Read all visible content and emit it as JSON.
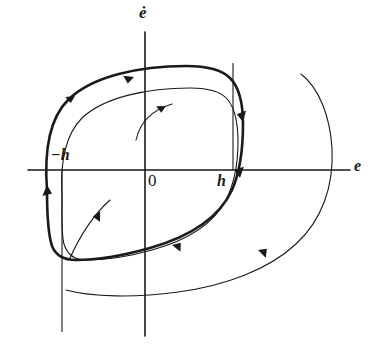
{
  "figure": {
    "background_color": "#ffffff",
    "ink_color": "#1a1a1a",
    "width": 380,
    "height": 350
  },
  "axes": {
    "horizontal": {
      "label": "e",
      "origin_px": [
        145,
        170
      ],
      "x_start_px": 28,
      "x_end_px": 350
    },
    "vertical": {
      "label": "ė",
      "y_start_px": 32,
      "y_end_px": 336
    },
    "origin_label": "0"
  },
  "switching_lines": [
    {
      "name": "negative-threshold",
      "label": "−h",
      "x_px": 62,
      "y_from_px": 170,
      "y_to_px": 332
    },
    {
      "name": "positive-threshold",
      "label": "h",
      "x_px": 233,
      "y_from_px": 63,
      "y_to_px": 170
    }
  ],
  "curves": [
    {
      "name": "outer-limit-cycle",
      "style": "thick",
      "stroke_width": 2.6,
      "path": "M 47 190 C 44 150 50 118 68 100 C 92 76 140 66 186 66 C 208 66 222 70 230 78 C 240 88 243 104 243 124 C 243 150 240 172 232 190 C 220 216 192 236 150 248 C 118 257 92 260 76 260 C 64 260 56 256 52 246 C 48 234 47 212 47 190 Z"
    },
    {
      "name": "inner-limit-cycle",
      "style": "thin",
      "stroke_width": 1.1,
      "path": "M 62 196 C 60 162 66 134 82 118 C 104 97 148 88 190 88 C 210 88 222 92 228 100 C 236 110 238 124 238 142 C 238 164 234 184 226 200 C 214 223 188 240 152 250 C 124 258 100 260 86 260 C 74 260 67 254 64 244 C 61 232 62 214 62 196 Z"
    },
    {
      "name": "outer-transient-trajectory",
      "style": "thin",
      "stroke_width": 1.1,
      "path": "M 301 74 C 319 88 330 116 332 148 C 334 186 322 220 296 244 C 268 270 224 286 178 292 C 134 298 92 297 66 290"
    },
    {
      "name": "upper-inner-spiral-arc",
      "style": "thin",
      "stroke_width": 1.1,
      "path": "M 136 140 C 140 122 152 110 172 104"
    },
    {
      "name": "lower-inner-spiral-arc",
      "style": "thin",
      "stroke_width": 1.1,
      "path": "M 70 258 C 80 236 92 216 110 200"
    }
  ],
  "arrows": [
    {
      "name": "arrow-upper-left-outer",
      "x": 75,
      "y": 96,
      "angle": -28,
      "size": 9
    },
    {
      "name": "arrow-upper-mid",
      "x": 134,
      "y": 77,
      "angle": -16,
      "size": 10
    },
    {
      "name": "arrow-upper-inner-spiral",
      "x": 166,
      "y": 106,
      "angle": -24,
      "size": 9
    },
    {
      "name": "arrow-right-descend",
      "x": 243,
      "y": 122,
      "angle": 82,
      "size": 11
    },
    {
      "name": "arrow-right-threshold",
      "x": 240,
      "y": 178,
      "angle": 86,
      "size": 11
    },
    {
      "name": "arrow-left-ascend",
      "x": 47,
      "y": 185,
      "angle": -90,
      "size": 11
    },
    {
      "name": "arrow-inner-descend",
      "x": 100,
      "y": 222,
      "angle": 68,
      "size": 10
    },
    {
      "name": "arrow-bottom-mid",
      "x": 172,
      "y": 245,
      "angle": 196,
      "size": 10
    },
    {
      "name": "arrow-bottom-outer",
      "x": 258,
      "y": 250,
      "angle": 202,
      "size": 10
    }
  ]
}
